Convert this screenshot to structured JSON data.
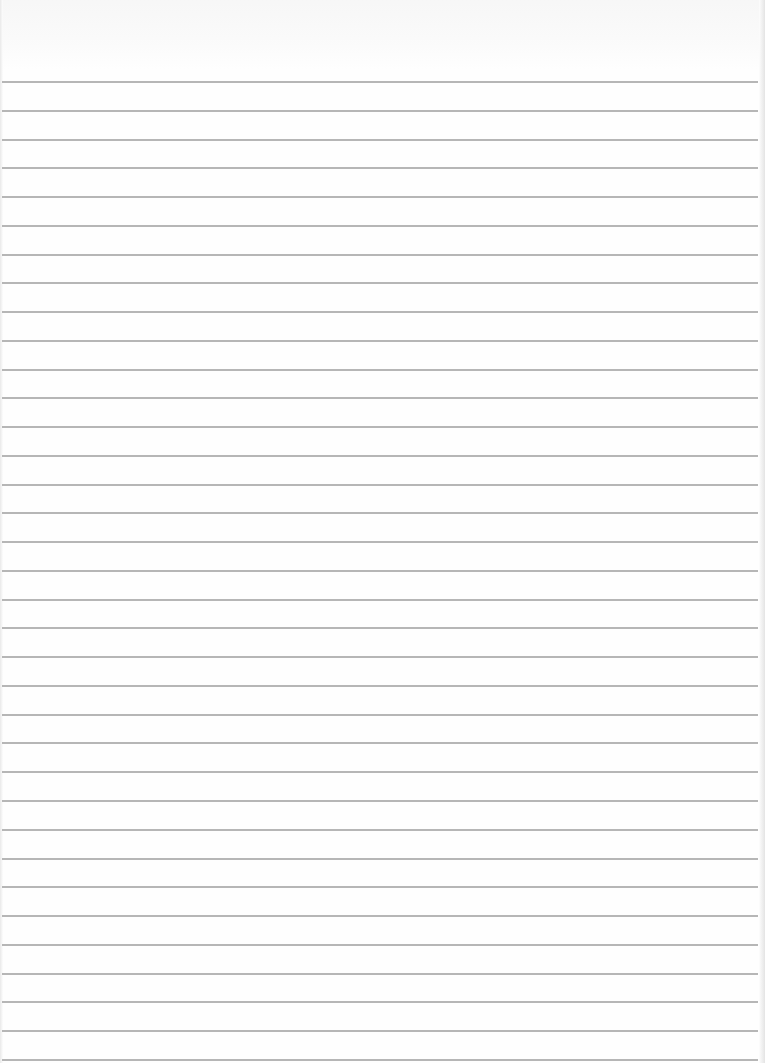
{
  "page": {
    "type": "lined-paper",
    "width": 765,
    "height": 1063,
    "background_color": "#fefefe",
    "rule_color": "#a9a9a9",
    "first_rule_y": 81,
    "rule_spacing": 28.76,
    "rule_count": 35,
    "rule_left": 2,
    "rule_right": 758
  }
}
